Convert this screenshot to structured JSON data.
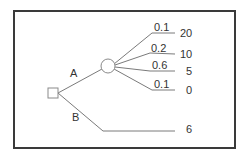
{
  "diagram": {
    "type": "decision-tree",
    "decision_node": {
      "shape": "square"
    },
    "chance_node": {
      "shape": "circle"
    },
    "branches": [
      {
        "label": "A",
        "leads_to": "chance-node",
        "outcomes": [
          {
            "probability": "0.1",
            "payoff": "20"
          },
          {
            "probability": "0.2",
            "payoff": "10"
          },
          {
            "probability": "0.6",
            "payoff": "5"
          },
          {
            "probability": "0.1",
            "payoff": "0"
          }
        ]
      },
      {
        "label": "B",
        "payoff": "6"
      }
    ]
  },
  "colors": {
    "frame": "#3a3a3a",
    "edges": "#7a7a7a",
    "text": "#333333",
    "background": "#ffffff"
  }
}
